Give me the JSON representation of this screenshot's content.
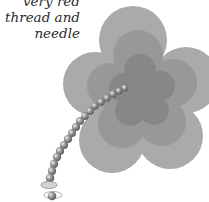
{
  "caption": {
    "lines": [
      "very red",
      "thread and",
      "needle"
    ]
  },
  "illustration": {
    "subject": "flower with beaded thread and needle",
    "colors": {
      "outer_petals": "#a9a9a9",
      "middle_petals": "#979797",
      "inner_petals": "#868686",
      "bead": "#7a7a7a",
      "bead_highlight": "#e8e8e8",
      "needle_eye": "#cfcfcf"
    }
  }
}
